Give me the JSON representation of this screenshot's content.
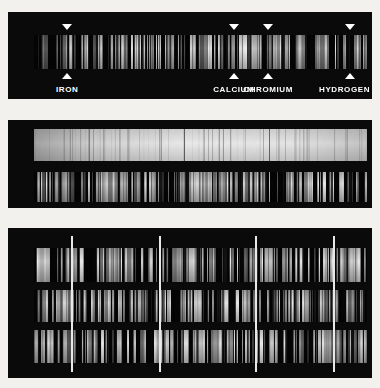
{
  "figure": {
    "background_color": "#f3f1ed",
    "panel_color": "#0a0a0a",
    "marker_color": "#ffffff",
    "reference_line_color": "#e8e8e8"
  },
  "panels": [
    {
      "id": "panel-reference-spectrum",
      "name": "reference-comparison-spectrum",
      "strips": [
        {
          "id": "strip-1-main",
          "kind": "emission",
          "seed": 1471,
          "line_count": 150,
          "brightness": 0.95
        }
      ],
      "markers": [
        {
          "label": "IRON",
          "x_pct": 16.2,
          "has_down_arrow": true,
          "has_up_arrow": true
        },
        {
          "label": "CALCIUM",
          "x_pct": 62.0,
          "has_down_arrow": true,
          "has_up_arrow": true
        },
        {
          "label": "CHROMIUM",
          "x_pct": 71.5,
          "has_down_arrow": true,
          "has_up_arrow": true
        },
        {
          "label": "HYDROGEN",
          "x_pct": 94.0,
          "has_down_arrow": true,
          "has_up_arrow": true
        }
      ]
    },
    {
      "id": "panel-continuum-and-lines",
      "name": "continuum-absorption-panel",
      "strips": [
        {
          "id": "strip-2-continuum",
          "kind": "continuum",
          "seed": 2207,
          "line_count": 90,
          "brightness": 0.88,
          "divider_positions_pct": [
            45.0,
            70.5
          ]
        },
        {
          "id": "strip-2-emission",
          "kind": "emission",
          "seed": 3319,
          "line_count": 170,
          "brightness": 0.9
        }
      ],
      "markers": []
    },
    {
      "id": "panel-three-star-spectra",
      "name": "stellar-spectra-comparison-panel",
      "strips": [
        {
          "id": "strip-3a",
          "kind": "emission",
          "seed": 5101,
          "line_count": 160,
          "brightness": 0.92
        },
        {
          "id": "strip-3b",
          "kind": "emission",
          "seed": 6173,
          "line_count": 155,
          "brightness": 0.9
        },
        {
          "id": "strip-3c",
          "kind": "emission",
          "seed": 7219,
          "line_count": 165,
          "brightness": 0.93
        }
      ],
      "reference_lines_pct": [
        17.3,
        41.5,
        67.9,
        89.3
      ],
      "markers": []
    }
  ],
  "chart_data": {
    "type": "heatmap",
    "xlabel": "wavelength (increasing to the right)",
    "ylabel": "plate / exposure",
    "legend": [
      "IRON",
      "CALCIUM",
      "CHROMIUM",
      "HYDROGEN"
    ],
    "annotations": [
      {
        "label": "IRON",
        "x_pct": 16.2,
        "panel": 1
      },
      {
        "label": "CALCIUM",
        "x_pct": 62.0,
        "panel": 1
      },
      {
        "label": "CHROMIUM",
        "x_pct": 71.5,
        "panel": 1
      },
      {
        "label": "HYDROGEN",
        "x_pct": 94.0,
        "panel": 1
      }
    ],
    "reference_lines_pct": [
      17.3,
      41.5,
      67.9,
      89.3
    ],
    "grid": false
  }
}
